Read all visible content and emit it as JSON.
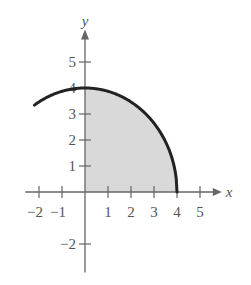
{
  "chart_data": {
    "type": "area",
    "title": "",
    "xlabel": "x",
    "ylabel": "y",
    "xlim": [
      -2.5,
      5.5
    ],
    "ylim": [
      -2.5,
      5.8
    ],
    "x_ticks": [
      -2,
      -1,
      1,
      2,
      3,
      4,
      5
    ],
    "y_ticks": [
      -2,
      1,
      2,
      3,
      4,
      5
    ],
    "x_tick_labels": [
      "−2",
      "−1",
      "1",
      "2",
      "3",
      "4",
      "5"
    ],
    "y_tick_labels": [
      "−2",
      "1",
      "2",
      "3",
      "4",
      "5"
    ],
    "curve": {
      "equation": "y = sqrt(16 - x^2)",
      "x_range": [
        -2.2,
        4
      ],
      "points": [
        [
          -2.2,
          3.34
        ],
        [
          -2,
          3.46
        ],
        [
          -1,
          3.87
        ],
        [
          0,
          4
        ],
        [
          1,
          3.87
        ],
        [
          2,
          3.46
        ],
        [
          3,
          2.65
        ],
        [
          3.5,
          1.94
        ],
        [
          4,
          0
        ]
      ]
    },
    "shaded_region": {
      "description": "region under curve from x=0 to x=4",
      "x_range": [
        0,
        4
      ],
      "color": "#d9d9d9"
    },
    "grid": false,
    "legend": null
  },
  "labels": {
    "x_axis": "x",
    "y_axis": "y"
  }
}
